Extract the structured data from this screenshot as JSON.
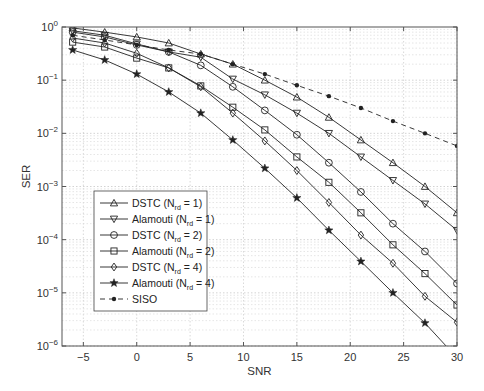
{
  "chart_data": {
    "type": "line",
    "title": "",
    "xlabel": "SNR",
    "ylabel": "SER",
    "xscale": "linear",
    "yscale": "log",
    "xlim": [
      -7,
      30
    ],
    "ylim": [
      1e-06,
      1
    ],
    "xticks": [
      -5,
      0,
      5,
      10,
      15,
      20,
      25,
      30
    ],
    "yticks": [
      {
        "value": 1,
        "base": "10",
        "exp": "0"
      },
      {
        "value": 0.1,
        "base": "10",
        "exp": "−1"
      },
      {
        "value": 0.01,
        "base": "10",
        "exp": "−2"
      },
      {
        "value": 0.001,
        "base": "10",
        "exp": "−3"
      },
      {
        "value": 0.0001,
        "base": "10",
        "exp": "−4"
      },
      {
        "value": 1e-05,
        "base": "10",
        "exp": "−5"
      },
      {
        "value": 1e-06,
        "base": "10",
        "exp": "−6"
      }
    ],
    "grid": true,
    "legend_position": "lower left",
    "x": [
      -6,
      -3,
      0,
      3,
      6,
      9,
      12,
      15,
      18,
      21,
      24,
      27,
      30
    ],
    "series": [
      {
        "name": "DSTC (N_rd = 1)",
        "label_main": "DSTC (N",
        "label_sub": "rd",
        "label_tail": " = 1)",
        "marker": "triangle-up",
        "dash": false,
        "values": [
          0.96,
          0.8,
          0.65,
          0.5,
          0.31,
          0.2,
          0.1,
          0.048,
          0.02,
          0.0075,
          0.0028,
          0.001,
          0.00032
        ]
      },
      {
        "name": "Alamouti (N_rd = 1)",
        "label_main": "Alamouti (N",
        "label_sub": "rd",
        "label_tail": " = 1)",
        "marker": "triangle-down",
        "dash": false,
        "values": [
          0.85,
          0.7,
          0.48,
          0.34,
          0.27,
          0.105,
          0.053,
          0.024,
          0.01,
          0.0036,
          0.0013,
          0.00047,
          0.00015
        ]
      },
      {
        "name": "DSTC (N_rd = 2)",
        "label_main": "DSTC (N",
        "label_sub": "rd",
        "label_tail": " = 2)",
        "marker": "circle",
        "dash": false,
        "values": [
          0.8,
          0.65,
          0.46,
          0.34,
          0.19,
          0.075,
          0.027,
          0.0094,
          0.0028,
          0.00079,
          0.0002,
          6e-05,
          1.5e-05
        ]
      },
      {
        "name": "Alamouti (N_rd = 2)",
        "label_main": "Alamouti (N",
        "label_sub": "rd",
        "label_tail": " = 2)",
        "marker": "square",
        "dash": false,
        "values": [
          0.52,
          0.42,
          0.26,
          0.17,
          0.078,
          0.031,
          0.0116,
          0.0036,
          0.0012,
          0.00032,
          8e-05,
          2.3e-05,
          5.9e-06
        ]
      },
      {
        "name": "DSTC (N_rd = 4)",
        "label_main": "DSTC (N",
        "label_sub": "rd",
        "label_tail": " = 4)",
        "marker": "diamond",
        "dash": false,
        "values": [
          0.62,
          0.5,
          0.32,
          0.17,
          0.075,
          0.024,
          0.0072,
          0.002,
          0.0005,
          0.000122,
          3.6e-05,
          8.6e-06,
          2.8e-06
        ]
      },
      {
        "name": "Alamouti (N_rd = 4)",
        "label_main": "Alamouti (N",
        "label_sub": "rd",
        "label_tail": " = 4)",
        "marker": "star",
        "dash": false,
        "values": [
          0.37,
          0.24,
          0.13,
          0.06,
          0.024,
          0.0075,
          0.0022,
          0.00061,
          0.00015,
          3.9e-05,
          1e-05,
          2.7e-06,
          6e-07
        ]
      },
      {
        "name": "SISO",
        "label_main": "SISO",
        "label_sub": "",
        "label_tail": "",
        "marker": "dot",
        "dash": true,
        "values": [
          0.7,
          0.57,
          0.46,
          0.37,
          0.31,
          0.2,
          0.13,
          0.08,
          0.05,
          0.03,
          0.017,
          0.01,
          0.0058
        ]
      }
    ]
  }
}
